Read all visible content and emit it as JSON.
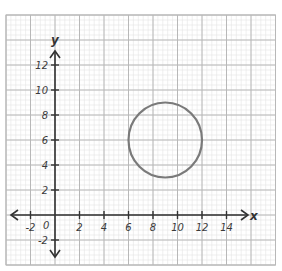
{
  "chart_data": {
    "type": "scatter",
    "title": "",
    "xlabel": "x",
    "ylabel": "y",
    "xlim": [
      -4,
      18
    ],
    "ylim": [
      -4,
      16
    ],
    "grid": true,
    "origin_label": "0",
    "x_ticks": [
      -2,
      2,
      4,
      6,
      8,
      10,
      12,
      14
    ],
    "x_tick_labels": [
      "-2",
      "2",
      "4",
      "6",
      "8",
      "10",
      "12",
      "14"
    ],
    "y_ticks": [
      12,
      10,
      8,
      6,
      4,
      2,
      -2
    ],
    "y_tick_labels": [
      "12",
      "10",
      "8",
      "6",
      "4",
      "2",
      "-2"
    ],
    "shapes": [
      {
        "kind": "circle",
        "center": [
          9,
          6
        ],
        "radius": 3
      }
    ]
  },
  "colors": {
    "major_grid": "#b8b8b8",
    "minor_grid": "#e4e4e4",
    "axis": "#333333",
    "circle": "#7a7a7a"
  }
}
